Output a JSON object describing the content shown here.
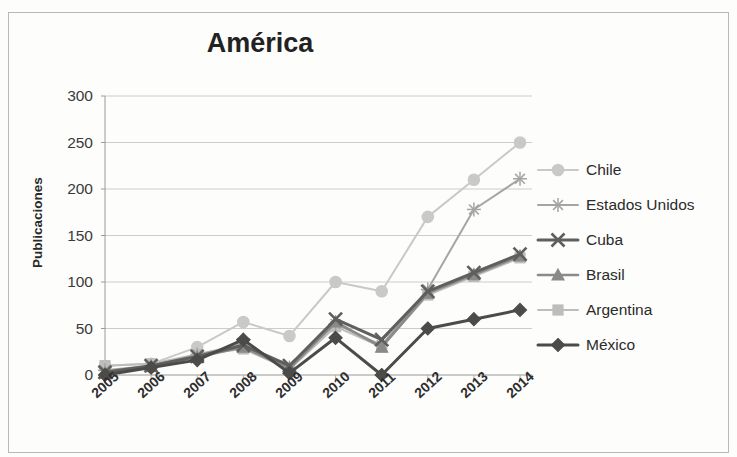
{
  "chart_data": {
    "type": "line",
    "title": "América",
    "xlabel": "",
    "ylabel": "Publicaciones",
    "categories": [
      "2005",
      "2006",
      "2007",
      "2008",
      "2009",
      "2010",
      "2011",
      "2012",
      "2013",
      "2014"
    ],
    "ylim": [
      0,
      300
    ],
    "ytick_values": [
      0,
      50,
      100,
      150,
      200,
      250,
      300
    ],
    "ytick_labels": [
      "0",
      "50",
      "100",
      "150",
      "200",
      "250",
      "300"
    ],
    "grid": true,
    "legend_position": "right",
    "series": [
      {
        "name": "Chile",
        "marker": "circle",
        "color": "#c9c9c7",
        "values": [
          10,
          12,
          30,
          57,
          42,
          100,
          90,
          170,
          210,
          250
        ]
      },
      {
        "name": "Estados Unidos",
        "marker": "asterisk",
        "color": "#a5a5a3",
        "values": [
          5,
          10,
          22,
          33,
          8,
          55,
          32,
          92,
          178,
          211
        ]
      },
      {
        "name": "Cuba",
        "marker": "x",
        "color": "#5f5f5d",
        "values": [
          3,
          10,
          20,
          32,
          10,
          60,
          38,
          90,
          110,
          130
        ]
      },
      {
        "name": "Brasil",
        "marker": "triangle",
        "color": "#8a8a88",
        "values": [
          2,
          9,
          19,
          30,
          7,
          57,
          30,
          88,
          108,
          128
        ]
      },
      {
        "name": "Argentina",
        "marker": "square",
        "color": "#bdbdbb",
        "values": [
          10,
          12,
          22,
          28,
          6,
          52,
          30,
          86,
          106,
          126
        ]
      },
      {
        "name": "México",
        "marker": "diamond",
        "color": "#4b4b49",
        "values": [
          0,
          8,
          16,
          38,
          2,
          40,
          0,
          50,
          60,
          70
        ]
      }
    ]
  },
  "legend": {
    "items": [
      {
        "label": "Chile"
      },
      {
        "label": "Estados Unidos"
      },
      {
        "label": "Cuba"
      },
      {
        "label": "Brasil"
      },
      {
        "label": "Argentina"
      },
      {
        "label": "México"
      }
    ]
  }
}
